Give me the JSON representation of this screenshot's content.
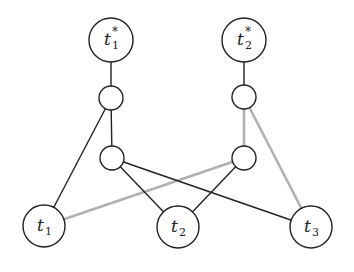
{
  "diagram": {
    "colors": {
      "edge_black": "#222222",
      "edge_gray": "#b0b0b0",
      "node_stroke": "#222222",
      "node_fill": "#ffffff"
    },
    "nodes": [
      {
        "id": "t1_star",
        "label_base": "t",
        "label_sub": "1",
        "label_sup": "*",
        "x": 111,
        "y": 40,
        "r": 22
      },
      {
        "id": "t2_star",
        "label_base": "t",
        "label_sub": "2",
        "label_sup": "*",
        "x": 244,
        "y": 40,
        "r": 22
      },
      {
        "id": "a1",
        "label_base": "",
        "x": 111,
        "y": 98,
        "r": 12
      },
      {
        "id": "b1",
        "label_base": "",
        "x": 112,
        "y": 158,
        "r": 12
      },
      {
        "id": "a2",
        "label_base": "",
        "x": 244,
        "y": 97,
        "r": 12
      },
      {
        "id": "b2",
        "label_base": "",
        "x": 244,
        "y": 158,
        "r": 12
      },
      {
        "id": "t1",
        "label_base": "t",
        "label_sub": "1",
        "x": 44,
        "y": 226,
        "r": 21
      },
      {
        "id": "t2",
        "label_base": "t",
        "label_sub": "2",
        "x": 178,
        "y": 227,
        "r": 21
      },
      {
        "id": "t3",
        "label_base": "t",
        "label_sub": "3",
        "x": 311,
        "y": 227,
        "r": 21
      }
    ],
    "edges": [
      {
        "from": "t1_star",
        "to": "a1",
        "color": "black"
      },
      {
        "from": "a1",
        "to": "b1",
        "color": "black"
      },
      {
        "from": "a1",
        "to": "t1",
        "color": "black"
      },
      {
        "from": "b1",
        "to": "t2",
        "color": "black"
      },
      {
        "from": "b1",
        "to": "t3",
        "color": "black"
      },
      {
        "from": "t2_star",
        "to": "a2",
        "color": "black"
      },
      {
        "from": "a2",
        "to": "b2",
        "color": "gray"
      },
      {
        "from": "a2",
        "to": "t3",
        "color": "gray"
      },
      {
        "from": "b2",
        "to": "t1",
        "color": "gray"
      },
      {
        "from": "b2",
        "to": "t2",
        "color": "black"
      }
    ]
  }
}
